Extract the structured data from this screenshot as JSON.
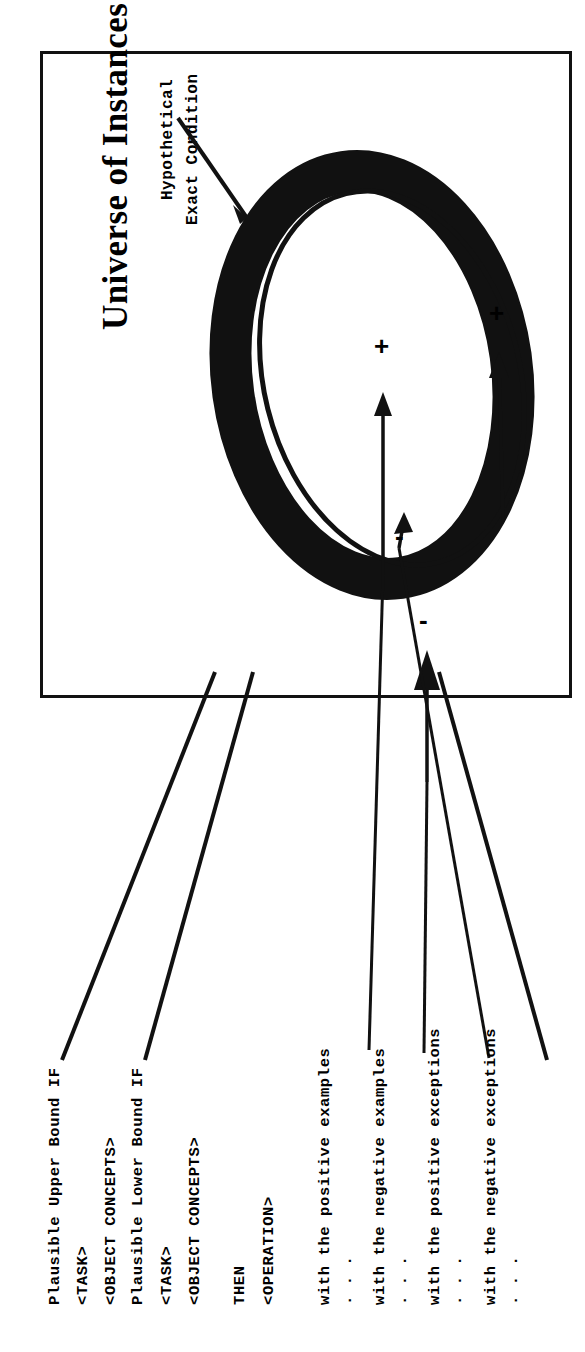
{
  "figure": {
    "title": "Universe of Instances",
    "callout": {
      "line1": "Hypothetical",
      "line2": "Exact Condition"
    },
    "markers": [
      {
        "id": "positive-example",
        "symbol": "+"
      },
      {
        "id": "positive-exception",
        "symbol": "+"
      },
      {
        "id": "negative-exception",
        "symbol": "-"
      },
      {
        "id": "negative-example",
        "symbol": "-"
      }
    ]
  },
  "rule": {
    "lines": [
      "Plausible Upper Bound IF",
      "<TASK>",
      "<OBJECT CONCEPTS>",
      "Plausible Lower Bound IF",
      "<TASK>",
      "<OBJECT CONCEPTS>",
      "THEN",
      "<OPERATION>"
    ],
    "upper_bound_if": "Plausible Upper Bound IF",
    "upper_task": "<TASK>",
    "upper_concepts": "<OBJECT CONCEPTS>",
    "lower_bound_if": "Plausible Lower Bound IF",
    "lower_task": "<TASK>",
    "lower_concepts": "<OBJECT CONCEPTS>",
    "then": "THEN",
    "operation": "<OPERATION>"
  },
  "legend": {
    "ellipsis": "...",
    "items": [
      {
        "label": "with the positive examples",
        "dots": "..."
      },
      {
        "label": "with the negative examples",
        "dots": "..."
      },
      {
        "label": "with the positive exceptions",
        "dots": "..."
      },
      {
        "label": "with the negative exceptions",
        "dots": "..."
      }
    ]
  },
  "colors": {
    "ink": "#111111",
    "paper": "#ffffff"
  }
}
